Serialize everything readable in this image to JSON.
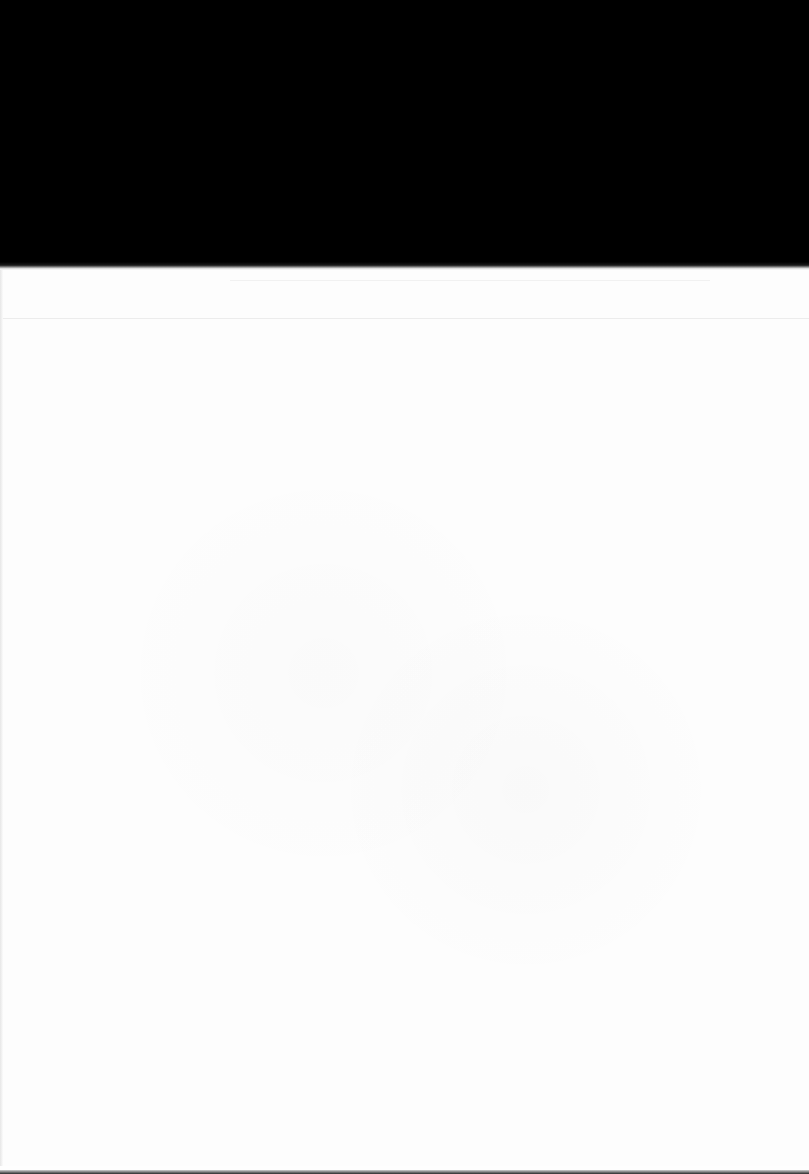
{
  "document": {
    "type": "scanned-page",
    "visible_text": [],
    "colors": {
      "top_band": "#000000",
      "paper": "#fdfdfd",
      "faint_rule": "#ececec"
    }
  }
}
